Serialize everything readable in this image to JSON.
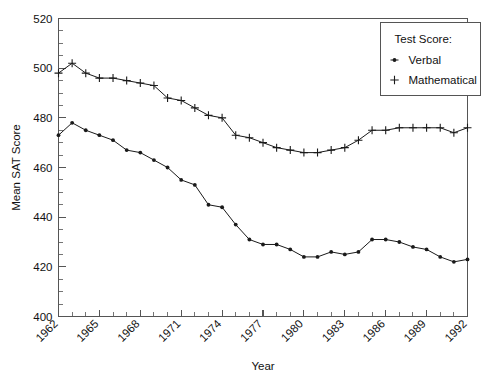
{
  "chart_data": {
    "type": "line",
    "title": "",
    "xlabel": "Year",
    "ylabel": "Mean SAT Score",
    "xlim": [
      1962,
      1992
    ],
    "ylim": [
      400,
      520
    ],
    "ytick_step": 20,
    "yminor_step": 5,
    "xtick_step": 1,
    "xlabel_step": 3,
    "grid": false,
    "legend_position": "top-right",
    "legend_title": "Test Score:",
    "ytick_labels": [
      "400",
      "420",
      "440",
      "460",
      "480",
      "500",
      "520"
    ],
    "ytick_values": [
      400,
      420,
      440,
      460,
      480,
      500,
      520
    ],
    "xtick_labels": [
      "1962",
      "1965",
      "1968",
      "1971",
      "1974",
      "1977",
      "1980",
      "1983",
      "1986",
      "1989",
      "1992"
    ],
    "xtick_values": [
      1962,
      1965,
      1968,
      1971,
      1974,
      1977,
      1980,
      1983,
      1986,
      1989,
      1992
    ],
    "x": [
      1962,
      1963,
      1964,
      1965,
      1966,
      1967,
      1968,
      1969,
      1970,
      1971,
      1972,
      1973,
      1974,
      1975,
      1976,
      1977,
      1978,
      1979,
      1980,
      1981,
      1982,
      1983,
      1984,
      1985,
      1986,
      1987,
      1988,
      1989,
      1990,
      1991,
      1992
    ],
    "series": [
      {
        "name": "Verbal",
        "marker": "dot",
        "values": [
          473,
          478,
          475,
          473,
          471,
          467,
          466,
          463,
          460,
          455,
          453,
          445,
          444,
          437,
          431,
          429,
          429,
          427,
          424,
          424,
          426,
          425,
          426,
          431,
          431,
          430,
          428,
          427,
          424,
          422,
          423
        ]
      },
      {
        "name": "Mathematical",
        "marker": "plus",
        "values": [
          498,
          502,
          498,
          496,
          496,
          495,
          494,
          493,
          488,
          487,
          484,
          481,
          480,
          473,
          472,
          470,
          468,
          467,
          466,
          466,
          467,
          468,
          471,
          475,
          475,
          476,
          476,
          476,
          476,
          474,
          476
        ]
      }
    ]
  },
  "legend": {
    "title": "Test Score:",
    "items": [
      {
        "label": "Verbal",
        "marker": "dot"
      },
      {
        "label": "Mathematical",
        "marker": "plus"
      }
    ]
  },
  "axes": {
    "x_title": "Year",
    "y_title": "Mean SAT Score"
  },
  "colors": {
    "line": "#1a1a1a",
    "axis": "#555555",
    "background": "#ffffff",
    "text": "#111111"
  }
}
